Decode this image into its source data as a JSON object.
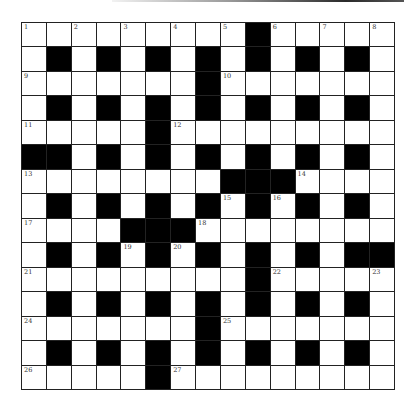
{
  "puzzle": {
    "rows": 15,
    "cols": 15,
    "colors": {
      "black": "#000000",
      "white": "#ffffff",
      "line": "#222222"
    },
    "layout": [
      ".........#.....",
      ".#.#.#.#.#.#.#.",
      ".......#.......",
      ".#.#.#.#.#.#.#.",
      ".....#.........",
      "##.#.#.#.#.#.#.",
      "........###....",
      ".#.#.#.#.#.#.#.",
      "....###........",
      ".#.#.#.#.#.#.##",
      ".........#.....",
      ".#.#.#.#.#.#.#.",
      ".......#.......",
      ".#.#.#.#.#.#.#.",
      ".....#........."
    ],
    "numbers": [
      {
        "n": "1",
        "r": 0,
        "c": 0
      },
      {
        "n": "2",
        "r": 0,
        "c": 2
      },
      {
        "n": "3",
        "r": 0,
        "c": 4
      },
      {
        "n": "4",
        "r": 0,
        "c": 6
      },
      {
        "n": "5",
        "r": 0,
        "c": 8
      },
      {
        "n": "6",
        "r": 0,
        "c": 10
      },
      {
        "n": "7",
        "r": 0,
        "c": 12
      },
      {
        "n": "8",
        "r": 0,
        "c": 14
      },
      {
        "n": "9",
        "r": 2,
        "c": 0
      },
      {
        "n": "10",
        "r": 2,
        "c": 8
      },
      {
        "n": "11",
        "r": 4,
        "c": 0
      },
      {
        "n": "12",
        "r": 4,
        "c": 6
      },
      {
        "n": "13",
        "r": 6,
        "c": 0
      },
      {
        "n": "14",
        "r": 6,
        "c": 11
      },
      {
        "n": "15",
        "r": 7,
        "c": 8
      },
      {
        "n": "16",
        "r": 7,
        "c": 10
      },
      {
        "n": "17",
        "r": 8,
        "c": 0
      },
      {
        "n": "18",
        "r": 8,
        "c": 7
      },
      {
        "n": "19",
        "r": 9,
        "c": 4
      },
      {
        "n": "20",
        "r": 9,
        "c": 6
      },
      {
        "n": "21",
        "r": 10,
        "c": 0
      },
      {
        "n": "22",
        "r": 10,
        "c": 10
      },
      {
        "n": "23",
        "r": 10,
        "c": 14
      },
      {
        "n": "24",
        "r": 12,
        "c": 0
      },
      {
        "n": "25",
        "r": 12,
        "c": 8
      },
      {
        "n": "26",
        "r": 14,
        "c": 0
      },
      {
        "n": "27",
        "r": 14,
        "c": 6
      }
    ]
  }
}
